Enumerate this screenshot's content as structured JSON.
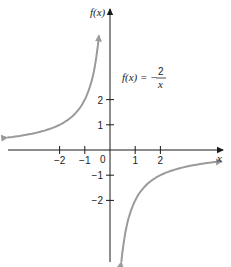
{
  "chart_data": {
    "type": "line",
    "title": "",
    "function_label": {
      "lhs": "f(x) = −",
      "numerator": "2",
      "denominator": "x"
    },
    "xlabel": "x",
    "ylabel": "f(x)",
    "x_ticks": [
      -2,
      -1,
      1,
      2
    ],
    "y_ticks": [
      2,
      1,
      -1,
      -2
    ],
    "x_tick_labels": [
      "−2",
      "−1",
      "1",
      "2"
    ],
    "y_tick_labels": [
      "2",
      "1",
      "−1",
      "−2"
    ],
    "origin_label": "0",
    "xlim": [
      -4.1,
      4.5
    ],
    "ylim": [
      -4.5,
      5.6
    ],
    "grid": false,
    "series": [
      {
        "name": "f(x) = -2/x, x<0",
        "x": [
          -4.08,
          -3,
          -2,
          -1.5,
          -1,
          -0.8,
          -0.6,
          -0.5,
          -0.44
        ],
        "values": [
          0.49,
          0.67,
          1,
          1.33,
          2,
          2.5,
          3.33,
          4,
          4.55
        ]
      },
      {
        "name": "f(x) = -2/x, x>0",
        "x": [
          0.45,
          0.5,
          0.6,
          0.8,
          1,
          1.5,
          2,
          3,
          4.44
        ],
        "values": [
          -4.44,
          -4,
          -3.33,
          -2.5,
          -2,
          -1.33,
          -1,
          -0.67,
          -0.45
        ]
      }
    ],
    "colors": {
      "axis": "#1a1a1a",
      "curve": "#9a9a9a"
    }
  }
}
